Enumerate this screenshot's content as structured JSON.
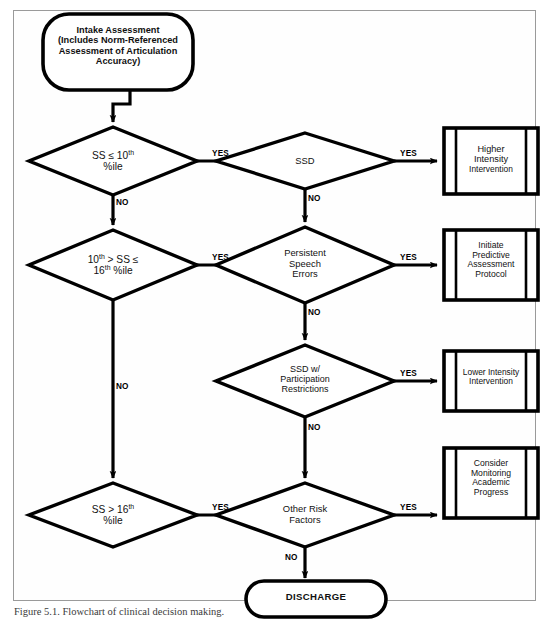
{
  "figure": {
    "caption": "Figure 5.1. Flowchart of clinical decision making.",
    "frame_color": "#9a9a9a",
    "line_color": "#000000",
    "background": "#ffffff"
  },
  "nodes": {
    "start": {
      "type": "terminator",
      "lines": [
        "Intake Assessment",
        "(Includes Norm-Referenced",
        "Assessment of Articulation",
        "Accuracy)"
      ]
    },
    "decision_ss10": {
      "type": "decision",
      "line1_pre": "SS ",
      "line1_op": "≤",
      "line1_num": " 10",
      "line1_sup": "th",
      "line2": "%ile"
    },
    "decision_ss16": {
      "type": "decision",
      "line1_num": "10",
      "line1_sup": "th",
      "line1_mid": " > SS ",
      "line1_op": "≤",
      "line2_num": "16",
      "line2_sup": "th",
      "line2_tail": " %ile"
    },
    "decision_ssgt16": {
      "type": "decision",
      "line1_pre": "SS > 16",
      "line1_sup": "th",
      "line2": "%ile"
    },
    "decision_ssd": {
      "type": "decision",
      "lines": [
        "SSD"
      ]
    },
    "decision_persistent": {
      "type": "decision",
      "lines": [
        "Persistent",
        "Speech",
        "Errors"
      ]
    },
    "decision_participation": {
      "type": "decision",
      "lines": [
        "SSD w/",
        "Participation",
        "Restrictions"
      ]
    },
    "decision_risk": {
      "type": "decision",
      "lines": [
        "Other Risk",
        "Factors"
      ]
    },
    "process_higher": {
      "type": "predefined-process",
      "lines": [
        "Higher",
        "Intensity",
        "Intervention"
      ]
    },
    "process_initiate": {
      "type": "predefined-process",
      "lines": [
        "Initiate",
        "Predictive",
        "Assessment",
        "Protocol"
      ]
    },
    "process_lower": {
      "type": "predefined-process",
      "lines": [
        "Lower Intensity",
        "Intervention"
      ]
    },
    "process_monitor": {
      "type": "predefined-process",
      "lines": [
        "Consider",
        "Monitoring",
        "Academic",
        "Progress"
      ]
    },
    "end_discharge": {
      "type": "terminator",
      "lines": [
        "DISCHARGE"
      ]
    }
  },
  "edges": {
    "yes_1": "YES",
    "yes_2": "YES",
    "yes_3": "YES",
    "yes_4": "YES",
    "yes_5": "YES",
    "yes_6": "YES",
    "yes_7": "YES",
    "no_1": "NO",
    "no_2": "NO",
    "no_3": "NO",
    "no_4": "NO",
    "no_5": "NO",
    "no_6": "NO"
  }
}
